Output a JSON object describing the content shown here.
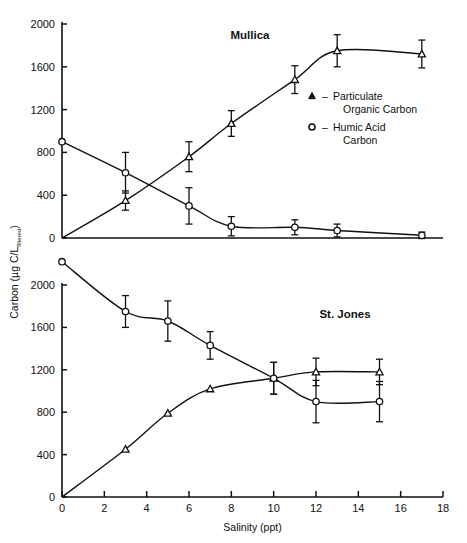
{
  "figure": {
    "background": "#ffffff",
    "ink": "#111111",
    "xlabel": "Salinity (ppt)",
    "ylabel_main": "Carbon (µg C/L",
    "ylabel_sub": "filtered",
    "ylabel_close": ")"
  },
  "legend": {
    "entries": [
      {
        "marker": "triangle-marker",
        "dash": "–",
        "line1": "Particulate",
        "line2": "Organic Carbon"
      },
      {
        "marker": "circle-marker",
        "dash": "–",
        "line1": "Humic Acid",
        "line2": "Carbon"
      }
    ]
  },
  "chart_data": {
    "type": "line",
    "title": "",
    "xlabel": "Salinity (ppt)",
    "ylabel": "Carbon (µg C/L filtered)",
    "xlim": [
      0,
      18
    ],
    "xticks": [
      0,
      2,
      4,
      6,
      8,
      10,
      12,
      14,
      16,
      18
    ],
    "xticklabels": [
      "0",
      "2",
      "4",
      "6",
      "8",
      "10",
      "12",
      "14",
      "16",
      "18"
    ],
    "grid": false,
    "legend_position": "center-right",
    "panels": [
      {
        "name": "Mullica",
        "annotation": "Mullica",
        "ylim": [
          0,
          2000
        ],
        "yticks": [
          0,
          400,
          800,
          1200,
          1600,
          2000
        ],
        "yticklabels": [
          "0",
          "400",
          "800",
          "1200",
          "1600",
          "2000"
        ],
        "series": [
          {
            "name": "Particulate Organic Carbon",
            "marker": "triangle",
            "x": [
              0,
              3,
              6,
              8,
              11,
              13,
              17
            ],
            "values": [
              0,
              350,
              760,
              1070,
              1480,
              1750,
              1720
            ],
            "yerr": [
              0,
              90,
              140,
              120,
              130,
              150,
              130
            ]
          },
          {
            "name": "Humic Acid Carbon",
            "marker": "circle",
            "x": [
              0,
              3,
              6,
              8,
              11,
              13,
              17
            ],
            "values": [
              900,
              610,
              300,
              110,
              100,
              70,
              25
            ],
            "yerr": [
              0,
              190,
              170,
              90,
              70,
              60,
              30
            ]
          }
        ]
      },
      {
        "name": "St. Jones",
        "annotation": "St. Jones",
        "ylim": [
          0,
          2200
        ],
        "yticks": [
          0,
          400,
          800,
          1200,
          1600,
          2000
        ],
        "yticklabels": [
          "0",
          "400",
          "800",
          "1200",
          "1600",
          "2000"
        ],
        "series": [
          {
            "name": "Particulate Organic Carbon",
            "marker": "triangle",
            "x": [
              0,
              3,
              5,
              7,
              10,
              12,
              15
            ],
            "values": [
              0,
              450,
              790,
              1020,
              1120,
              1180,
              1180
            ],
            "yerr": [
              0,
              0,
              0,
              0,
              150,
              130,
              120
            ]
          },
          {
            "name": "Humic Acid Carbon",
            "marker": "circle",
            "x": [
              0,
              3,
              5,
              7,
              10,
              12,
              15
            ],
            "values": [
              2220,
              1750,
              1660,
              1430,
              1120,
              900,
              900
            ],
            "yerr": [
              0,
              150,
              190,
              130,
              150,
              200,
              190
            ]
          }
        ]
      }
    ]
  }
}
